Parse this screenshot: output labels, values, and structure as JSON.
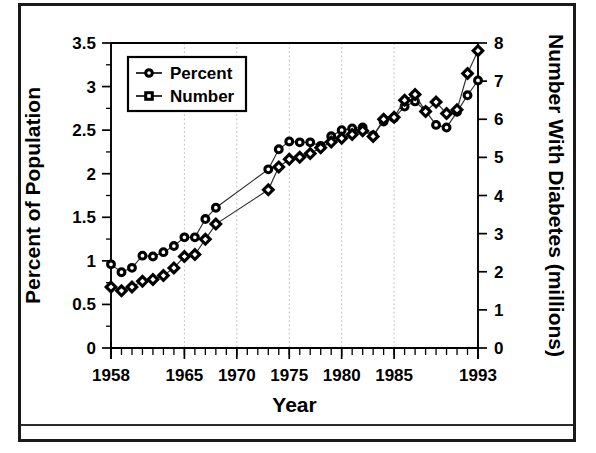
{
  "figure": {
    "has_border": true,
    "border_color": "#1a1a1a",
    "background_color": "#ffffff"
  },
  "chart_data": {
    "type": "line",
    "title": "",
    "subtitle": "",
    "xlabel": "Year",
    "ylabel": "Percent of Population",
    "y2label": "Number With Diabetes (millions)",
    "xlim": [
      1958,
      1993
    ],
    "ylim": [
      0,
      3.5
    ],
    "y2lim": [
      0,
      8
    ],
    "yticks": [
      0,
      0.5,
      1,
      1.5,
      2,
      2.5,
      3,
      3.5
    ],
    "ytick_labels": [
      "0",
      "0.5",
      "1",
      "1.5",
      "2",
      "2.5",
      "3",
      "3.5"
    ],
    "y2ticks": [
      0,
      1,
      2,
      3,
      4,
      5,
      6,
      7,
      8
    ],
    "y2tick_labels": [
      "0",
      "1",
      "2",
      "3",
      "4",
      "5",
      "6",
      "7",
      "8"
    ],
    "xticks": [
      1958,
      1965,
      1970,
      1975,
      1980,
      1985,
      1993
    ],
    "xtick_labels": [
      "1958",
      "1965",
      "1970",
      "1975",
      "1980",
      "1985",
      "1993"
    ],
    "grid": "vertical-dotted",
    "gridline_years": [
      1965,
      1970,
      1975,
      1980,
      1985
    ],
    "legend_position": "upper-left",
    "legend_entries": [
      {
        "label": "Percent",
        "marker": "circle",
        "axis": "left"
      },
      {
        "label": "Number",
        "marker": "square",
        "axis": "right"
      }
    ],
    "series": [
      {
        "name": "Percent",
        "marker": "circle",
        "axis": "left",
        "units": "percent of population",
        "x": [
          1958,
          1959,
          1960,
          1961,
          1962,
          1963,
          1964,
          1965,
          1966,
          1967,
          1968,
          1973,
          1974,
          1975,
          1976,
          1977,
          1978,
          1979,
          1980,
          1981,
          1982,
          1983,
          1984,
          1985,
          1986,
          1987,
          1988,
          1989,
          1990,
          1991,
          1992,
          1993
        ],
        "values": [
          0.96,
          0.87,
          0.92,
          1.06,
          1.05,
          1.1,
          1.17,
          1.27,
          1.27,
          1.48,
          1.61,
          2.05,
          2.28,
          2.37,
          2.36,
          2.36,
          2.32,
          2.43,
          2.5,
          2.52,
          2.53,
          2.44,
          2.6,
          2.64,
          2.77,
          2.83,
          2.72,
          2.56,
          2.53,
          2.71,
          2.9,
          3.07
        ]
      },
      {
        "name": "Number",
        "marker": "square",
        "axis": "right",
        "units": "millions",
        "x": [
          1958,
          1959,
          1960,
          1961,
          1962,
          1963,
          1964,
          1965,
          1966,
          1967,
          1968,
          1973,
          1974,
          1975,
          1976,
          1977,
          1978,
          1979,
          1980,
          1981,
          1982,
          1983,
          1984,
          1985,
          1986,
          1987,
          1988,
          1989,
          1990,
          1991,
          1992,
          1993
        ],
        "values": [
          1.6,
          1.5,
          1.6,
          1.75,
          1.8,
          1.9,
          2.1,
          2.4,
          2.45,
          2.85,
          3.25,
          4.15,
          4.75,
          4.95,
          5.0,
          5.1,
          5.25,
          5.4,
          5.5,
          5.6,
          5.7,
          5.55,
          6.0,
          6.05,
          6.5,
          6.65,
          6.2,
          6.45,
          6.15,
          6.25,
          7.2,
          7.8
        ]
      }
    ]
  }
}
